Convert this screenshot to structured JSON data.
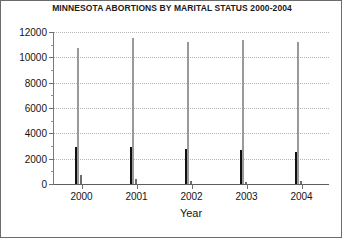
{
  "chart_data": {
    "type": "bar",
    "title": "MINNESOTA ABORTIONS BY MARITAL STATUS 2000-2004",
    "xlabel": "Year",
    "ylabel": "",
    "categories": [
      "2000",
      "2001",
      "2002",
      "2003",
      "2004"
    ],
    "ylim": [
      0,
      12000
    ],
    "yticks": [
      0,
      2000,
      4000,
      6000,
      8000,
      10000,
      12000
    ],
    "ytick_labels": [
      "0",
      "2000",
      "4000",
      "6000",
      "8000",
      "10000",
      "12000"
    ],
    "minor_ticks": true,
    "grid": "horizontal-dotted",
    "legend": "none",
    "series": [
      {
        "name": "Married",
        "color": "#111111",
        "values": [
          2900,
          2950,
          2750,
          2650,
          2550
        ]
      },
      {
        "name": "Unmarried",
        "color": "#ffffff",
        "values": [
          10700,
          11500,
          11250,
          11350,
          11200
        ]
      },
      {
        "name": "Unknown",
        "color": "#808080",
        "values": [
          750,
          400,
          250,
          150,
          200
        ]
      }
    ]
  }
}
